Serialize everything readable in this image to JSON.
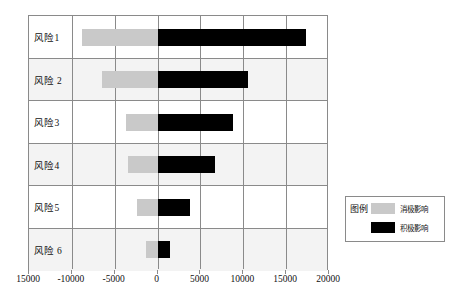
{
  "chart_data": {
    "type": "bar",
    "title": "",
    "subtitle": "",
    "xlabel": "",
    "ylabel": "",
    "orientation": "horizontal",
    "style": "tornado",
    "grid": true,
    "xlim": [
      -15000,
      20000
    ],
    "xticks": [
      -15000,
      -10000,
      -5000,
      0,
      5000,
      10000,
      15000,
      20000
    ],
    "xticklabels": [
      "15000",
      "-10000",
      "-5000",
      "0",
      "5000",
      "10000",
      "15000",
      "20000"
    ],
    "categories": [
      "风险1",
      "风险 2",
      "风险3",
      "风险4",
      "风险5",
      "风险 6"
    ],
    "series": [
      {
        "name": "消极影响",
        "color": "#c9c9c9",
        "values": [
          -8800,
          -6500,
          -3700,
          -3500,
          -2400,
          -1300
        ]
      },
      {
        "name": "积极影响",
        "color": "#000000",
        "values": [
          17300,
          10500,
          8800,
          6700,
          3800,
          1500
        ]
      }
    ],
    "legend": {
      "position": "right",
      "title": "图例",
      "entries": [
        {
          "label": "消极影响",
          "color": "#c9c9c9"
        },
        {
          "label": "积极影响",
          "color": "#000000"
        }
      ]
    }
  },
  "colors": {
    "negative": "#c9c9c9",
    "positive": "#000000",
    "grid": "#8a8a8a",
    "band_shaded": "#f3f3f3",
    "background": "#ffffff",
    "text": "#111111"
  }
}
